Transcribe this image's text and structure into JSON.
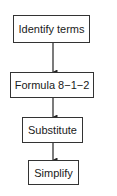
{
  "diagram": {
    "type": "flowchart",
    "direction": "top-to-bottom",
    "nodes": [
      {
        "id": "n1",
        "label": "Identify terms"
      },
      {
        "id": "n2",
        "label": "Formula 8−1−2"
      },
      {
        "id": "n3",
        "label": "Substitute"
      },
      {
        "id": "n4",
        "label": "Simplify"
      }
    ],
    "edges": [
      {
        "from": "n1",
        "to": "n2"
      },
      {
        "from": "n2",
        "to": "n3"
      },
      {
        "from": "n3",
        "to": "n4"
      }
    ]
  },
  "colors": {
    "stroke": "#333333",
    "background": "#ffffff",
    "text": "#1a1a1a"
  }
}
